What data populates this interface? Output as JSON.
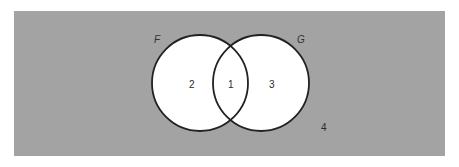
{
  "diagram": {
    "type": "venn",
    "colors": {
      "universe_fill": "#a3a3a3",
      "set_fill": "#ffffff",
      "outline": "#222222",
      "page_background": "#ffffff"
    },
    "universe": {
      "region_label": "4"
    },
    "sets": [
      {
        "name": "F",
        "region_label": "2"
      },
      {
        "name": "G",
        "region_label": "3"
      }
    ],
    "intersection": {
      "region_label": "1"
    }
  }
}
